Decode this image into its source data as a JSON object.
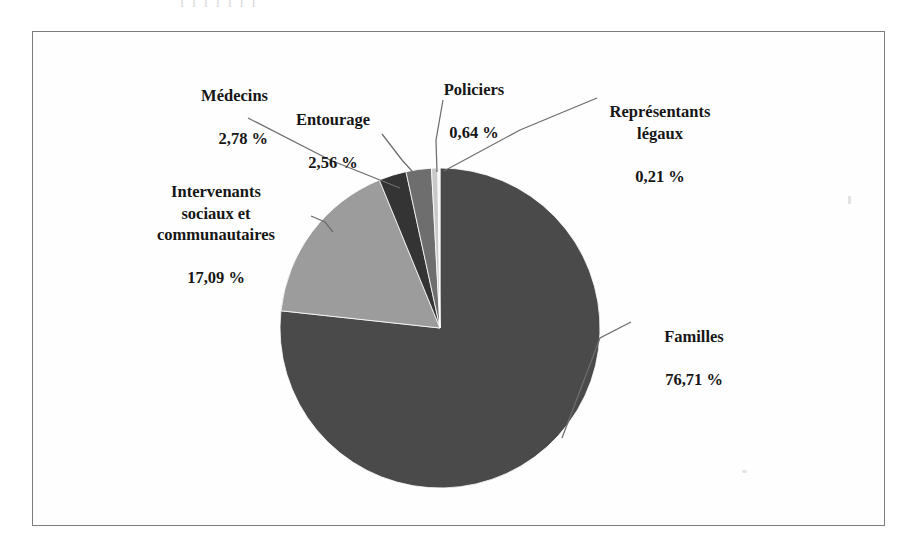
{
  "figure": {
    "frame": {
      "border_color": "#7c7c7c",
      "background": "#fefefe"
    },
    "scan_artifact_text": "l  l   l  l  l        l  l"
  },
  "chart_data": {
    "type": "pie",
    "title": "",
    "subtitle": "",
    "xlabel": "",
    "ylabel": "",
    "legend_position": "none",
    "labels_format": "name + percent, callout leader lines",
    "percent_symbol": "%",
    "decimal_separator": ",",
    "start_angle_deg": 0,
    "direction": "clockwise",
    "categories": [
      "Familles",
      "Intervenants sociaux et communautaires",
      "Médecins",
      "Entourage",
      "Policiers",
      "Représentants légaux"
    ],
    "values": [
      76.71,
      17.09,
      2.78,
      2.56,
      0.64,
      0.21
    ],
    "value_labels": [
      "76,71 %",
      "17,09 %",
      "2,78 %",
      "2,56 %",
      "0,64 %",
      "0,21 %"
    ],
    "colors": [
      "#4a4a4a",
      "#9c9c9c",
      "#343434",
      "#6e6e6e",
      "#c9c9c9",
      "#f2f2f2"
    ],
    "slices": [
      {
        "name": "Familles",
        "value": 76.71,
        "value_label": "76,71 %",
        "color": "#4a4a4a",
        "label_name": "Familles",
        "label_value": "76,71 %"
      },
      {
        "name": "Intervenants sociaux et communautaires",
        "value": 17.09,
        "value_label": "17,09 %",
        "color": "#9c9c9c",
        "label_name": "Intervenants\nsociaux et\ncommunautaires",
        "label_value": "17,09 %"
      },
      {
        "name": "Médecins",
        "value": 2.78,
        "value_label": "2,78 %",
        "color": "#343434",
        "label_name": "Médecins",
        "label_value": "2,78 %"
      },
      {
        "name": "Entourage",
        "value": 2.56,
        "value_label": "2,56 %",
        "color": "#6e6e6e",
        "label_name": "Entourage",
        "label_value": "2,56 %"
      },
      {
        "name": "Policiers",
        "value": 0.64,
        "value_label": "0,64 %",
        "color": "#c9c9c9",
        "label_name": "Policiers",
        "label_value": "0,64 %"
      },
      {
        "name": "Représentants légaux",
        "value": 0.21,
        "value_label": "0,21 %",
        "color": "#f2f2f2",
        "label_name": "Représentants\nlégaux",
        "label_value": "0,21 %"
      }
    ]
  }
}
